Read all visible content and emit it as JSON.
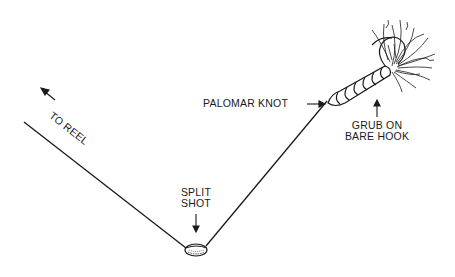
{
  "diagram": {
    "labels": {
      "to_reel": "TO REEL",
      "split_shot_line1": "SPLIT",
      "split_shot_line2": "SHOT",
      "palomar_knot": "PALOMAR KNOT",
      "grub_line1": "GRUB ON",
      "grub_line2": "BARE HOOK"
    },
    "colors": {
      "ink": "#1a1a1a",
      "background": "#ffffff"
    },
    "components": [
      "fishing-line",
      "split-shot",
      "palomar-knot",
      "grub",
      "bare-hook"
    ]
  }
}
